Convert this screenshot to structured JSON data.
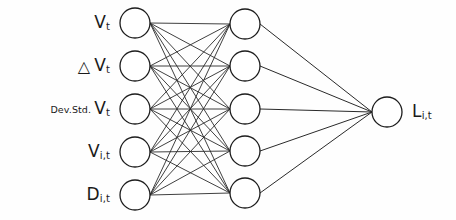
{
  "diagram": {
    "type": "neural-network",
    "background_color": "#fefefe",
    "stroke_color": "#1c1c1c",
    "node_fill": "#ffffff",
    "layers": [
      {
        "name": "input-layer",
        "node_count": 5,
        "center_x": 135,
        "radius": 15,
        "node_centers_y": [
          23,
          66,
          109,
          152,
          195
        ]
      },
      {
        "name": "hidden-layer",
        "node_count": 5,
        "center_x": 245,
        "radius": 15,
        "node_centers_y": [
          24,
          66,
          109,
          151,
          193
        ]
      },
      {
        "name": "output-layer",
        "node_count": 1,
        "center_x": 387,
        "radius": 15,
        "node_centers_y": [
          112
        ]
      }
    ],
    "connections": {
      "input_to_hidden": "fully-connected",
      "input_to_hidden_count": 25,
      "hidden_to_output": "fully-connected",
      "hidden_to_output_count": 5
    },
    "input_labels": [
      {
        "prefix": "",
        "delta": false,
        "base": "V",
        "sub": "t"
      },
      {
        "prefix": "",
        "delta": true,
        "base": "V",
        "sub": "t"
      },
      {
        "prefix": "Dev.Std.",
        "delta": false,
        "base": "V",
        "sub": "t"
      },
      {
        "prefix": "",
        "delta": false,
        "base": "V",
        "sub": "i,t"
      },
      {
        "prefix": "",
        "delta": false,
        "base": "D",
        "sub": "i,t"
      }
    ],
    "output_label": {
      "base": "L",
      "sub": "i,t"
    },
    "delta_symbol": "△"
  }
}
